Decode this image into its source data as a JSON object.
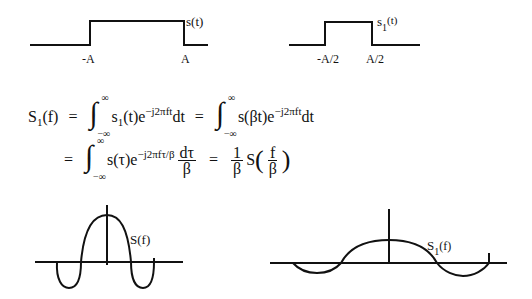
{
  "top_left_pulse": {
    "signal_label": "s(t)",
    "left_edge_label": "-A",
    "right_edge_label": "A",
    "edges": [
      -1,
      1
    ],
    "amplitude": 1
  },
  "top_right_pulse": {
    "signal_label_main": "s",
    "signal_label_sub": "1",
    "signal_label_arg": "(t)",
    "left_edge_label": "-A/2",
    "right_edge_label": "A/2",
    "edges": [
      -0.5,
      0.5
    ],
    "amplitude": 1
  },
  "equation": {
    "line1": {
      "lhs_main": "S",
      "lhs_sub": "1",
      "lhs_arg": "(f)",
      "eq1": "=",
      "int1_upper": "∞",
      "int1_lower": "−∞",
      "int1_body_a": "s",
      "int1_body_sub": "1",
      "int1_body_b": "(t)e",
      "int1_exp": "−j2πft",
      "int1_d": "dt",
      "eq2": "=",
      "int2_upper": "∞",
      "int2_lower": "−∞",
      "int2_body": "s(βt)e",
      "int2_exp": "−j2πft",
      "int2_d": "dt"
    },
    "line2": {
      "eq1": "=",
      "int_upper": "∞",
      "int_lower": "−∞",
      "int_body": "s(τ)e",
      "int_exp": "−j2πfτ/β",
      "frac1_num": "dτ",
      "frac1_den": "β",
      "eq2": "=",
      "frac2_num": "1",
      "frac2_den": "β",
      "result_fn": "S",
      "frac3_num": "f",
      "frac3_den": "β",
      "open_paren": "(",
      "close_paren": ")"
    }
  },
  "bottom_left_spectrum": {
    "label": "S(f)",
    "main_lobe_half_width": 1,
    "peak": 1
  },
  "bottom_right_spectrum": {
    "label_main": "S",
    "label_sub": "1",
    "label_arg": "(f)",
    "main_lobe_half_width": 2,
    "peak": 0.5
  }
}
